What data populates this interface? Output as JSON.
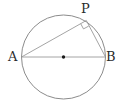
{
  "figure": {
    "type": "geometry-diagram",
    "width": 120,
    "height": 104,
    "background_color": "#ffffff",
    "stroke_color": "#8c8c8c",
    "chord_color": "#9a9a9a",
    "label_color": "#2b2b2b",
    "center_dot_color": "#1a1a1a",
    "circle": {
      "name": "circle",
      "center_x": 63.5,
      "center_y": 57,
      "radius": 42,
      "stroke_width": 1
    },
    "center_point": {
      "name": "center",
      "x": 63.5,
      "y": 57,
      "radius": 1.6,
      "label": ""
    },
    "points": [
      {
        "id": "A",
        "label": "A",
        "x": 21.5,
        "y": 57,
        "label_x": 8,
        "label_y": 50
      },
      {
        "id": "B",
        "label": "B",
        "x": 105.5,
        "y": 57,
        "label_x": 106,
        "label_y": 50
      },
      {
        "id": "P",
        "label": "P",
        "x": 86.3,
        "y": 20.5,
        "label_x": 81,
        "label_y": 2
      }
    ],
    "segments": [
      {
        "name": "diameter-AB",
        "from": "A",
        "to": "B",
        "x1": 21.5,
        "y1": 57,
        "x2": 105.5,
        "y2": 57
      },
      {
        "name": "chord-AP",
        "from": "A",
        "to": "P",
        "x1": 21.5,
        "y1": 57,
        "x2": 86.3,
        "y2": 20.5
      },
      {
        "name": "chord-PB",
        "from": "P",
        "to": "B",
        "x1": 86.3,
        "y1": 20.5,
        "x2": 105.5,
        "y2": 57
      }
    ],
    "right_angle_marker": {
      "name": "right-angle-at-P",
      "at_point": "P",
      "size": 7,
      "angle_degrees": 90,
      "path": "M 80.7 23.7 L 83.5 28.9 L 88.7 26.1"
    }
  }
}
